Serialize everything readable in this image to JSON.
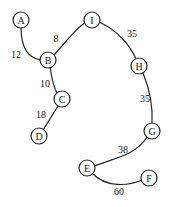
{
  "nodes": [
    {
      "id": "A",
      "label": "A",
      "x": 21,
      "y": 20
    },
    {
      "id": "B",
      "label": "B",
      "x": 48,
      "y": 60
    },
    {
      "id": "C",
      "label": "C",
      "x": 62,
      "y": 99
    },
    {
      "id": "D",
      "label": "D",
      "x": 39,
      "y": 136
    },
    {
      "id": "I",
      "label": "I",
      "x": 92,
      "y": 20
    },
    {
      "id": "H",
      "label": "H",
      "x": 139,
      "y": 66
    },
    {
      "id": "G",
      "label": "G",
      "x": 152,
      "y": 131
    },
    {
      "id": "E",
      "label": "E",
      "x": 87,
      "y": 168
    },
    {
      "id": "F",
      "label": "F",
      "x": 149,
      "y": 178
    }
  ],
  "edges": [
    {
      "from": "A",
      "to": "B",
      "weight": "12",
      "label_x": 16,
      "label_y": 54
    },
    {
      "from": "B",
      "to": "I",
      "weight": "8",
      "label_x": 56,
      "label_y": 38
    },
    {
      "from": "B",
      "to": "C",
      "weight": "10",
      "label_x": 45,
      "label_y": 83
    },
    {
      "from": "C",
      "to": "D",
      "weight": "18",
      "label_x": 41,
      "label_y": 114
    },
    {
      "from": "I",
      "to": "H",
      "weight": "35",
      "label_x": 132,
      "label_y": 33
    },
    {
      "from": "H",
      "to": "G",
      "weight": "35",
      "label_x": 145,
      "label_y": 98
    },
    {
      "from": "G",
      "to": "E",
      "weight": "38",
      "label_x": 123,
      "label_y": 149
    },
    {
      "from": "E",
      "to": "F",
      "weight": "60",
      "label_x": 119,
      "label_y": 191
    }
  ]
}
